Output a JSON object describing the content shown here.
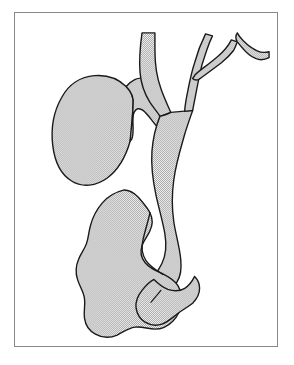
{
  "figure": {
    "caption": "",
    "frame": {
      "border_color": "#86888a",
      "background": "#ffffff",
      "x": 14,
      "y": 12,
      "width": 264,
      "height": 335
    },
    "style": {
      "outline_color": "#1a1a1a",
      "outline_width": 1.4,
      "fill_pattern": "stipple-checker",
      "fill_color": "#d8d8d8",
      "fill_background": "#ffffff",
      "page_background": "#ffffff"
    },
    "structures": [
      {
        "id": "common-hepatic-duct-trunk",
        "label": "Common hepatic duct / vertical trunk",
        "kind": "duct",
        "path": "M 403 70 C 398 110 393 150 392 190 C 392 232 400 275 412 318 C 424 360 436 400 441 443 C 446 488 445 534 452 578 C 457 612 470 640 483 662 C 492 678 500 692 500 706 C 500 722 490 736 474 744 C 458 752 442 752 432 745 C 421 737 420 722 426 706 C 432 690 443 676 450 660 C 459 640 462 616 460 590 C 457 552 448 512 444 472 C 440 430 440 388 434 348 C 428 308 418 268 418 228 C 418 188 424 148 430 108 C 433 92 435 80 436 70 Z"
      },
      {
        "id": "right-hepatic-branch",
        "label": "Right hepatic duct branch",
        "kind": "duct"
      },
      {
        "id": "accessory-branch",
        "label": "Accessory V-shaped branch (upper right)",
        "kind": "duct"
      },
      {
        "id": "gallbladder",
        "label": "Gallbladder",
        "kind": "organ"
      },
      {
        "id": "cystic-duct",
        "label": "Cystic duct",
        "kind": "duct"
      },
      {
        "id": "common-bile-duct",
        "label": "Common bile duct",
        "kind": "duct"
      },
      {
        "id": "duodenum",
        "label": "Duodenum (C-loop, lobulated)",
        "kind": "organ"
      },
      {
        "id": "duodenal-bulb",
        "label": "Duodenal bulb / distal sweep",
        "kind": "organ"
      }
    ]
  }
}
